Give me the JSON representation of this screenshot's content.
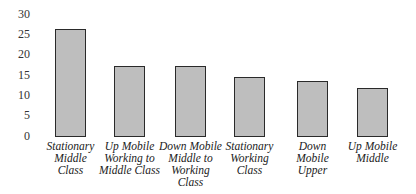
{
  "chart_data": {
    "type": "bar",
    "title": "",
    "xlabel": "",
    "ylabel": "",
    "ylim": [
      0,
      30
    ],
    "yticks": [
      0,
      5,
      10,
      15,
      20,
      25,
      30
    ],
    "grid": false,
    "legend": null,
    "categories": [
      "Stationary Middle Class",
      "Up Mobile Working to Middle Class",
      "Down Mobile Middle to Working Class",
      "Stationary Working Class",
      "Down Mobile Upper",
      "Up Mobile Middle"
    ],
    "category_display": [
      "Stationary\nMiddle\nClass",
      "Up Mobile\nWorking to\nMiddle Class",
      "Down Mobile\nMiddle to\nWorking\nClass",
      "Stationary\nWorking\nClass",
      "Down\nMobile\nUpper",
      "Up Mobile\nMiddle"
    ],
    "values": [
      26.2,
      17.1,
      17.0,
      14.5,
      13.3,
      11.8
    ],
    "bar_fill": "dotted light gray",
    "bar_edge_color": "#2a2a2a"
  }
}
